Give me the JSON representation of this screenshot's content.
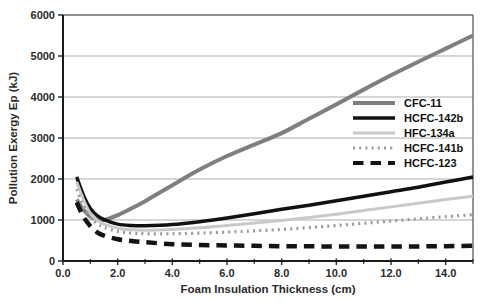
{
  "colors": {
    "background": "#ffffff",
    "grid": "#adadad",
    "frame": "#4d4d4d",
    "axis": "#1a1a1a",
    "tick": "#333333",
    "text": "#2b2b2b"
  },
  "chart_data": {
    "type": "line",
    "title": "",
    "xlabel": "Foam Insulation Thickness (cm)",
    "ylabel": "Pollution Exergy Ep (kJ)",
    "xlim": [
      0,
      15
    ],
    "ylim": [
      0,
      6000
    ],
    "grid": "horizontal",
    "legend_position": "inside-right",
    "x_major_ticks": [
      {
        "value": 0,
        "label": "0.0"
      },
      {
        "value": 2,
        "label": "2.0"
      },
      {
        "value": 4,
        "label": "4.0"
      },
      {
        "value": 6,
        "label": "6.0"
      },
      {
        "value": 8,
        "label": "8.0"
      },
      {
        "value": 10,
        "label": "10.0"
      },
      {
        "value": 12,
        "label": "12.0"
      },
      {
        "value": 14,
        "label": "14.0"
      }
    ],
    "x_minor_ticks": [
      1,
      3,
      5,
      7,
      9,
      11,
      13,
      15
    ],
    "y_ticks": [
      {
        "value": 0,
        "label": "0"
      },
      {
        "value": 1000,
        "label": "1000"
      },
      {
        "value": 2000,
        "label": "2000"
      },
      {
        "value": 3000,
        "label": "3000"
      },
      {
        "value": 4000,
        "label": "4000"
      },
      {
        "value": 5000,
        "label": "5000"
      },
      {
        "value": 6000,
        "label": "6000"
      }
    ],
    "x": [
      0.5,
      0.75,
      1,
      1.25,
      1.5,
      2,
      2.5,
      3,
      4,
      5,
      6,
      7,
      8,
      9,
      10,
      11,
      12,
      13,
      14,
      15
    ],
    "series": [
      {
        "name": "CFC-11",
        "color": "#7f7f7f",
        "width": 4,
        "dash": null,
        "values": [
          1500,
          1250,
          1080,
          1020,
          1000,
          1120,
          1280,
          1460,
          1850,
          2230,
          2560,
          2840,
          3120,
          3470,
          3820,
          4180,
          4530,
          4860,
          5180,
          5500
        ]
      },
      {
        "name": "HCFC-142b",
        "color": "#111111",
        "width": 3.5,
        "dash": null,
        "values": [
          2050,
          1600,
          1280,
          1110,
          1010,
          900,
          865,
          860,
          890,
          960,
          1050,
          1150,
          1260,
          1360,
          1470,
          1580,
          1690,
          1800,
          1925,
          2050
        ]
      },
      {
        "name": "HFC-134a",
        "color": "#c9c9c9",
        "width": 3,
        "dash": null,
        "values": [
          1930,
          1500,
          1160,
          990,
          900,
          800,
          760,
          750,
          770,
          810,
          865,
          925,
          990,
          1060,
          1140,
          1230,
          1320,
          1410,
          1500,
          1580
        ]
      },
      {
        "name": "HCFC-141b",
        "color": "#9b9b9b",
        "width": 3.2,
        "dash": "2 4.2",
        "values": [
          1750,
          1330,
          1060,
          910,
          820,
          720,
          680,
          665,
          665,
          680,
          705,
          735,
          770,
          815,
          865,
          920,
          975,
          1030,
          1080,
          1130
        ]
      },
      {
        "name": "HCFC-123",
        "color": "#141414",
        "width": 4.5,
        "dash": "10.5 7",
        "values": [
          1430,
          1080,
          850,
          700,
          620,
          530,
          490,
          460,
          410,
          390,
          380,
          370,
          362,
          358,
          355,
          353,
          353,
          356,
          362,
          372
        ]
      }
    ]
  }
}
